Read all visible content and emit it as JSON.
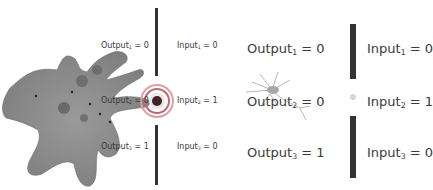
{
  "panels": [
    {
      "organism": "amoeba",
      "outputs": [
        {
          "name": "Output",
          "sub": "1",
          "value": "= 0"
        },
        {
          "name": "Output",
          "sub": "2",
          "value": "= 0"
        },
        {
          "name": "Output",
          "sub": "3",
          "value": "= 1"
        }
      ],
      "inputs": [
        {
          "name": "Input",
          "sub": "1",
          "value": "= 0"
        },
        {
          "name": "Input",
          "sub": "2",
          "value": "= 1"
        },
        {
          "name": "Input",
          "sub": "3",
          "value": "= 0"
        }
      ]
    },
    {
      "organism": "neuron",
      "outputs": [
        {
          "name": "Output",
          "sub": "1",
          "value": "= 0"
        },
        {
          "name": "Output",
          "sub": "2",
          "value": "= 0"
        },
        {
          "name": "Output",
          "sub": "3",
          "value": "= 1"
        }
      ],
      "inputs": [
        {
          "name": "Input",
          "sub": "1",
          "value": "= 0"
        },
        {
          "name": "Input",
          "sub": "2",
          "value": "= 1"
        },
        {
          "name": "Input",
          "sub": "3",
          "value": "= 0"
        }
      ]
    }
  ],
  "colors": {
    "barrier": "#333333",
    "amoeba": "#8a8a8a",
    "signal_ring": "#c0303a"
  }
}
